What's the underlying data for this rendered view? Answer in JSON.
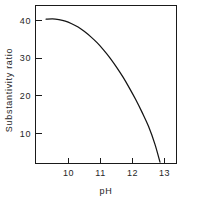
{
  "chart_data": {
    "type": "line",
    "title": "",
    "xlabel": "pH",
    "ylabel": "Substantivity ratio",
    "xlim": [
      9.3,
      13.6
    ],
    "ylim": [
      0,
      45
    ],
    "xticks": [
      10,
      11,
      12,
      13
    ],
    "xtick_labels": [
      "10",
      "11",
      "12",
      "13"
    ],
    "yticks": [
      10,
      20,
      30,
      40
    ],
    "ytick_labels": [
      "10",
      "20",
      "30",
      "40"
    ],
    "grid": false,
    "legend": null,
    "series": [
      {
        "name": "Substantivity ratio vs pH",
        "x": [
          9.3,
          9.5,
          9.7,
          9.9,
          10.1,
          10.3,
          10.5,
          10.7,
          10.9,
          11.1,
          11.3,
          11.5,
          11.7,
          11.9,
          12.1,
          12.3,
          12.5,
          12.7,
          12.86
        ],
        "y": [
          40.3,
          40.4,
          40.2,
          39.8,
          39.1,
          38.2,
          37.0,
          35.6,
          34.0,
          32.1,
          30.0,
          27.6,
          25.0,
          22.1,
          19.0,
          15.6,
          11.9,
          7.2,
          2.4
        ]
      }
    ]
  },
  "axes": {
    "frame_color": "#1a1a1a",
    "curve_color": "#141414",
    "background": "#ffffff"
  },
  "labels": {
    "x_axis_title": "pH",
    "y_axis_title": "Substantivity ratio"
  }
}
